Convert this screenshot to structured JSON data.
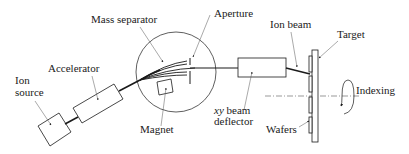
{
  "diagram": {
    "labels": {
      "ion_source_line1": "Ion",
      "ion_source_line2": "source",
      "accelerator": "Accelerator",
      "mass_separator": "Mass separator",
      "aperture": "Aperture",
      "magnet": "Magnet",
      "ion_beam": "Ion beam",
      "target": "Target",
      "indexing": "Indexing",
      "xy_prefix": "xy",
      "deflector_line1_rest": " beam",
      "deflector_line2": "deflector",
      "wafers": "Wafers"
    },
    "colors": {
      "stroke": "#1a1a1a",
      "background": "#ffffff",
      "leader": "#555555"
    }
  }
}
